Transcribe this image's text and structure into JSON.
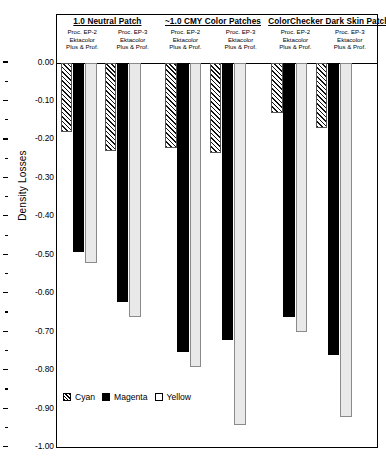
{
  "chart_data": {
    "type": "bar",
    "title": "",
    "xlabel": "",
    "ylabel": "Density Losses",
    "ylim": [
      -1.0,
      0.0
    ],
    "ytick_step": 0.1,
    "ytick_labels": [
      "0.00",
      "-0.10",
      "-0.20",
      "-0.30",
      "-0.40",
      "-0.50",
      "-0.60",
      "-0.70",
      "-0.80",
      "-0.90",
      "-1.00"
    ],
    "ytick_values": [
      0.0,
      -0.1,
      -0.2,
      -0.3,
      -0.4,
      -0.5,
      -0.6,
      -0.7,
      -0.8,
      -0.9,
      -1.0
    ],
    "grid": false,
    "legend_position": "inside-lower-left",
    "legend": [
      "Cyan",
      "Magenta",
      "Yellow"
    ],
    "series": [
      {
        "name": "Cyan",
        "values": [
          -0.18,
          -0.23,
          -0.22,
          -0.235,
          -0.13,
          -0.17
        ]
      },
      {
        "name": "Magenta",
        "values": [
          -0.49,
          -0.62,
          -0.75,
          -0.72,
          -0.66,
          -0.76
        ]
      },
      {
        "name": "Yellow",
        "values": [
          -0.52,
          -0.66,
          -0.79,
          -0.94,
          -0.7,
          -0.92
        ]
      }
    ],
    "categories": [
      "1.0 Neutral Patch / Proc. EP-2",
      "1.0 Neutral Patch / Proc. EP-3",
      "~1.0 CMY Color Patches / Proc. EP-2",
      "~1.0 CMY Color Patches / Proc. EP-3",
      "ColorChecker Dark Skin Patch / Proc. EP-2",
      "ColorChecker Dark Skin Patch / Proc. EP-3"
    ],
    "groups": [
      {
        "title": "1.0 Neutral Patch",
        "subgroups": [
          {
            "line1": "Proc. EP-2",
            "line2": "Ektacolor",
            "line3": "Plus & Prof.",
            "bars": [
              {
                "series": "Cyan",
                "value": -0.18
              },
              {
                "series": "Magenta",
                "value": -0.49
              },
              {
                "series": "Yellow",
                "value": -0.52
              }
            ]
          },
          {
            "line1": "Proc. EP-3",
            "line2": "Ektacolor",
            "line3": "Plus & Prof.",
            "bars": [
              {
                "series": "Cyan",
                "value": -0.23
              },
              {
                "series": "Magenta",
                "value": -0.62
              },
              {
                "series": "Yellow",
                "value": -0.66
              }
            ]
          }
        ]
      },
      {
        "title": "~1.0 CMY Color Patches",
        "subgroups": [
          {
            "line1": "Proc. EP-2",
            "line2": "Ektacolor",
            "line3": "Plus & Prof.",
            "bars": [
              {
                "series": "Cyan",
                "value": -0.22
              },
              {
                "series": "Magenta",
                "value": -0.75
              },
              {
                "series": "Yellow",
                "value": -0.79
              }
            ]
          },
          {
            "line1": "Proc. EP-3",
            "line2": "Ektacolor",
            "line3": "Plus & Prof.",
            "bars": [
              {
                "series": "Cyan",
                "value": -0.235
              },
              {
                "series": "Magenta",
                "value": -0.72
              },
              {
                "series": "Yellow",
                "value": -0.94
              }
            ]
          }
        ]
      },
      {
        "title": "ColorChecker Dark Skin Patch",
        "subgroups": [
          {
            "line1": "Proc. EP-2",
            "line2": "Ektacolor",
            "line3": "Plus & Prof.",
            "bars": [
              {
                "series": "Cyan",
                "value": -0.13
              },
              {
                "series": "Magenta",
                "value": -0.66
              },
              {
                "series": "Yellow",
                "value": -0.7
              }
            ]
          },
          {
            "line1": "Proc. EP-3",
            "line2": "Ektacolor",
            "line3": "Plus & Prof.",
            "bars": [
              {
                "series": "Cyan",
                "value": -0.17
              },
              {
                "series": "Magenta",
                "value": -0.76
              },
              {
                "series": "Yellow",
                "value": -0.92
              }
            ]
          }
        ]
      }
    ]
  },
  "axis": {
    "y_title": "Density Losses"
  },
  "legend": {
    "items": [
      {
        "label": "Cyan",
        "swatch": "hatched-swatch-icon"
      },
      {
        "label": "Magenta",
        "swatch": "solid-black-swatch-icon"
      },
      {
        "label": "Yellow",
        "swatch": "outline-swatch-icon"
      }
    ]
  }
}
